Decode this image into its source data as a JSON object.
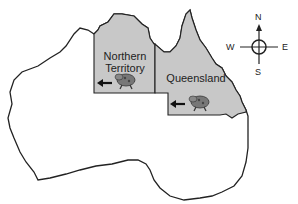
{
  "map": {
    "title": "Australia",
    "colors": {
      "land": "#ffffff",
      "highlight": "#c8c8c8",
      "outline": "#222222"
    },
    "regions": [
      {
        "name": "Northern Territory",
        "line1": "Northern",
        "line2": "Territory",
        "icon": "toad-icon",
        "arrow": "arrow-left-icon"
      },
      {
        "name": "Queensland",
        "label": "Queensland",
        "icon": "toad-icon",
        "arrow": "arrow-left-icon"
      }
    ],
    "compass": {
      "n": "N",
      "s": "S",
      "e": "E",
      "w": "W"
    }
  }
}
